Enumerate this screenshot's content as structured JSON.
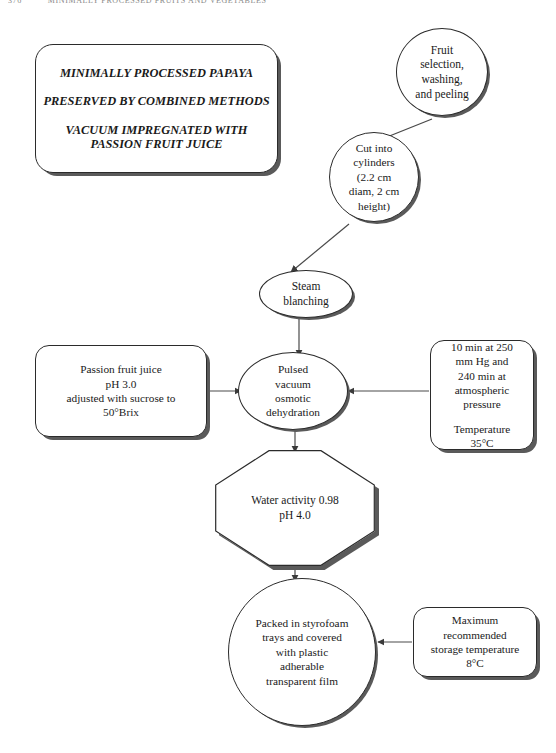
{
  "page": {
    "header_page_number": "376",
    "header_title": "MINIMALLY PROCESSED FRUITS AND VEGETABLES",
    "background_color": "#ffffff",
    "ink_color": "#1a1a1a",
    "shadow_color": "#5a5a5a"
  },
  "figure": {
    "type": "process-flowchart",
    "title_box": {
      "line1": "MINIMALLY PROCESSED PAPAYA",
      "line2": "PRESERVED BY COMBINED METHODS",
      "line3a": "VACUUM IMPREGNATED WITH",
      "line3b": "PASSION FRUIT JUICE"
    },
    "nodes": [
      {
        "id": "selection",
        "shape": "ellipse",
        "lines": [
          "Fruit",
          "selection,",
          "washing,",
          "and peeling"
        ]
      },
      {
        "id": "cut",
        "shape": "circle",
        "lines": [
          "Cut into",
          "cylinders",
          "(2.2 cm",
          "diam, 2 cm",
          "height)"
        ]
      },
      {
        "id": "blanching",
        "shape": "ellipse",
        "lines": [
          "Steam",
          "blanching"
        ]
      },
      {
        "id": "juice",
        "shape": "rounded-rect",
        "lines": [
          "Passion fruit juice",
          "pH 3.0",
          "adjusted with sucrose to",
          "50°Brix"
        ]
      },
      {
        "id": "pvod",
        "shape": "ellipse",
        "lines": [
          "Pulsed",
          "vacuum",
          "osmotic",
          "dehydration"
        ]
      },
      {
        "id": "pressure",
        "shape": "rounded-rect",
        "lines": [
          "10 min at 250",
          "mm Hg and",
          "240 min at",
          "atmospheric",
          "pressure"
        ],
        "lines2": [
          "Temperature",
          "35°C"
        ]
      },
      {
        "id": "properties",
        "shape": "octagon",
        "lines": [
          "Water activity 0.98",
          "pH 4.0"
        ]
      },
      {
        "id": "packaging",
        "shape": "circle",
        "lines": [
          "Packed in styrofoam",
          "trays and covered",
          "with plastic",
          "adherable",
          "transparent film"
        ]
      },
      {
        "id": "storage",
        "shape": "rounded-rect",
        "lines": [
          "Maximum",
          "recommended",
          "storage temperature",
          "8°C"
        ]
      }
    ],
    "connectors": [
      {
        "from": "selection",
        "to": "cut",
        "style": "diagonal-arrow"
      },
      {
        "from": "cut",
        "to": "blanching",
        "style": "diagonal-arrow"
      },
      {
        "from": "blanching",
        "to": "pvod",
        "style": "vertical-arrow"
      },
      {
        "from": "juice",
        "to": "pvod",
        "style": "horizontal-arrow-right"
      },
      {
        "from": "pressure",
        "to": "pvod",
        "style": "horizontal-arrow-left"
      },
      {
        "from": "pvod",
        "to": "properties",
        "style": "vertical-arrow"
      },
      {
        "from": "properties",
        "to": "packaging",
        "style": "vertical-arrow"
      },
      {
        "from": "storage",
        "to": "packaging",
        "style": "horizontal-arrow-left"
      }
    ]
  }
}
